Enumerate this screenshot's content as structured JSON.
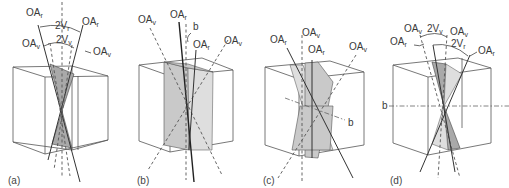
{
  "figure": {
    "type": "optic-axis-dispersion-diagram",
    "panels": [
      {
        "id": "a",
        "caption": "(a)",
        "labels": {
          "oa_r_left": {
            "main": "OA",
            "sub": "r"
          },
          "oa_r_right": {
            "main": "OA",
            "sub": "r"
          },
          "two_v_r": {
            "main": "2V",
            "sub": "r"
          },
          "oa_v_left": {
            "main": "OA",
            "sub": "v"
          },
          "two_v_v": {
            "main": "2V",
            "sub": "v"
          },
          "oa_v_right": {
            "main": "OA",
            "sub": "v"
          }
        }
      },
      {
        "id": "b",
        "caption": "(b)",
        "labels": {
          "oa_v_left": {
            "main": "OA",
            "sub": "v"
          },
          "oa_r_top": {
            "main": "OA",
            "sub": "r"
          },
          "b_axis": "b",
          "oa_r_mid": {
            "main": "OA",
            "sub": "r"
          },
          "oa_v_right": {
            "main": "OA",
            "sub": "v"
          }
        }
      },
      {
        "id": "c",
        "caption": "(c)",
        "labels": {
          "oa_r_left": {
            "main": "OA",
            "sub": "r"
          },
          "oa_v_top": {
            "main": "OA",
            "sub": "v"
          },
          "oa_r_mid": {
            "main": "OA",
            "sub": "r"
          },
          "oa_v_right": {
            "main": "OA",
            "sub": "v"
          },
          "b_axis": "b"
        }
      },
      {
        "id": "d",
        "caption": "(d)",
        "labels": {
          "oa_v_left": {
            "main": "OA",
            "sub": "v"
          },
          "two_v_v": {
            "main": "2V",
            "sub": "v"
          },
          "oa_v_right": {
            "main": "OA",
            "sub": "v"
          },
          "oa_r_left": {
            "main": "OA",
            "sub": "r"
          },
          "two_v_r": {
            "main": "2V",
            "sub": "r"
          },
          "oa_r_right": {
            "main": "OA",
            "sub": "r"
          },
          "b_axis": "b"
        }
      }
    ]
  },
  "colors": {
    "line": "#333333",
    "shade": "#c9c9c9",
    "shade_dark": "#a9a9a9",
    "background": "#ffffff"
  }
}
